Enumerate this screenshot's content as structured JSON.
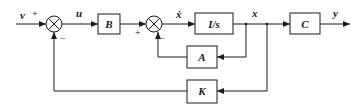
{
  "diagram": {
    "type": "state-feedback block diagram",
    "signals": {
      "input": "v",
      "control": "u",
      "state_derivative": "ẋ",
      "state": "x",
      "output": "y"
    },
    "blocks": {
      "B": "B",
      "integrator": "I/s",
      "C": "C",
      "A": "A",
      "K": "K"
    },
    "summing_junctions": [
      {
        "id": "sum1",
        "plus_sign": "+",
        "minus_sign": "−"
      },
      {
        "id": "sum2",
        "plus_sign": "+",
        "minus_sign": "−"
      }
    ],
    "colors": {
      "line": "#1a1a1a",
      "background": "#ffffff"
    }
  }
}
